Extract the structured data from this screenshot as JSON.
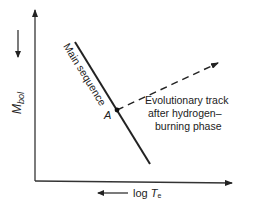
{
  "diagram": {
    "title": "",
    "y_axis": {
      "label_main": "M",
      "label_sub": "bol",
      "direction_hint": "down",
      "direction_meaning": "increasing magnitude (fainter) downward"
    },
    "x_axis": {
      "label_prefix": "log ",
      "label_main": "T",
      "label_sub": "e",
      "direction_hint": "left",
      "direction_meaning": "increasing temperature to the left"
    },
    "main_sequence": {
      "label": "Main sequence",
      "style": "solid"
    },
    "point": {
      "label": "A"
    },
    "evolutionary_track": {
      "style": "dashed",
      "lines": [
        "Evolutionary track",
        "after hydrogen–",
        "burning phase"
      ]
    },
    "colors": {
      "ink": "#222222",
      "background": "#ffffff"
    }
  }
}
